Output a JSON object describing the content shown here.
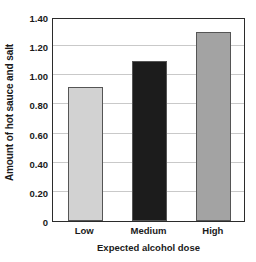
{
  "chart_data": {
    "type": "bar",
    "title": "",
    "categories": [
      "Low",
      "Medium",
      "High"
    ],
    "values": [
      0.92,
      1.1,
      1.3
    ],
    "series": [
      {
        "name": "Amount of hot sauce and salt",
        "values": [
          0.92,
          1.1,
          1.3
        ]
      }
    ],
    "xlabel": "Expected alcohol dose",
    "ylabel": "Amount of hot sauce and salt",
    "ylim": [
      0,
      1.4
    ],
    "ytick_values": [
      0,
      0.2,
      0.4,
      0.6,
      0.8,
      1.0,
      1.2,
      1.4
    ],
    "ytick_labels": [
      "0",
      "0.20",
      "0.40",
      "0.60",
      "0.80",
      "1.00",
      "1.20",
      "1.40"
    ],
    "grid": true,
    "grid_axis": "y",
    "legend": false,
    "legend_position": "none",
    "bar_colors": [
      "#d2d2d2",
      "#1c1c1c",
      "#a3a3a3"
    ],
    "bar_edge_color": "#555555",
    "frame_color": "#2b2b2b",
    "gridline_color": "#c9c9c9",
    "background_color": "#ffffff",
    "text_color": "#1a1a1a"
  },
  "axes": {
    "y_title": "Amount of hot sauce and salt",
    "x_title": "Expected alcohol dose"
  }
}
